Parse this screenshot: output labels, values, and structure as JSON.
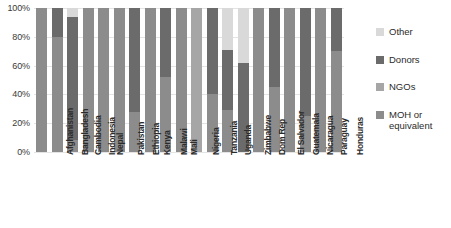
{
  "chart_data": {
    "type": "bar",
    "subtype": "100-percent-stacked-bar",
    "title": "",
    "xlabel": "",
    "ylabel": "",
    "ylim": [
      0,
      100
    ],
    "grid": true,
    "legend_position": "right",
    "y_ticks": [
      "100%",
      "80%",
      "60%",
      "40%",
      "20%",
      "0%"
    ],
    "y_tick_values": [
      100,
      80,
      60,
      40,
      20,
      0
    ],
    "categories": [
      "Afghanistan",
      "Bangladesh",
      "Cambodia",
      "Indonesia",
      "Nepal",
      "Pakistan",
      "Ethiopia",
      "Kenya",
      "Malawi",
      "Mali",
      "Nigeria",
      "Tanzania",
      "Uganda",
      "Zimbabwe",
      "Dom Rep",
      "El Salvador",
      "Guatemala",
      "Nicaragua",
      "Paraguay",
      "Honduras"
    ],
    "series": [
      {
        "name": "MOH or equivalent",
        "color": "#8c8c8c",
        "values": [
          100,
          80,
          8,
          100,
          100,
          100,
          28,
          100,
          52,
          100,
          0,
          40,
          29,
          0,
          100,
          45,
          100,
          25,
          100,
          70
        ]
      },
      {
        "name": "NGOs",
        "color": "#a6a6a6",
        "values": [
          0,
          0,
          0,
          0,
          0,
          0,
          0,
          0,
          0,
          0,
          100,
          0,
          0,
          0,
          0,
          0,
          0,
          0,
          0,
          0
        ]
      },
      {
        "name": "Donors",
        "color": "#6b6b6b",
        "values": [
          0,
          20,
          86,
          0,
          0,
          0,
          72,
          0,
          48,
          0,
          0,
          60,
          42,
          62,
          0,
          55,
          0,
          75,
          0,
          30
        ]
      },
      {
        "name": "Other",
        "color": "#d9d9d9",
        "values": [
          0,
          0,
          6,
          0,
          0,
          0,
          0,
          0,
          0,
          0,
          0,
          0,
          29,
          38,
          0,
          0,
          0,
          0,
          0,
          0
        ]
      }
    ],
    "stack_order_top_to_bottom": [
      "Other",
      "Donors",
      "NGOs",
      "MOH or equivalent"
    ]
  },
  "legend": {
    "items": [
      {
        "label": "Other",
        "color": "#d9d9d9"
      },
      {
        "label": "Donors",
        "color": "#6b6b6b"
      },
      {
        "label": "NGOs",
        "color": "#a6a6a6"
      },
      {
        "label": "MOH or\nequivalent",
        "color": "#8c8c8c"
      }
    ]
  },
  "colors": {
    "background": "#ffffff",
    "gridline": "#e4e4e4",
    "axis_text": "#3a3a3a",
    "label_text": "#2b2b2b"
  }
}
